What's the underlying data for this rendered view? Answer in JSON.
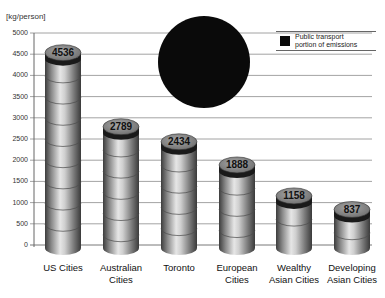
{
  "chart_data": {
    "type": "bar",
    "style": "3D cylinders with dark cap (public transport portion) and a large black circle overlay",
    "title": "",
    "ylabel": "[kg/person]",
    "xlabel": "",
    "ylim": [
      0,
      5000
    ],
    "yticks": [
      0,
      500,
      1000,
      1500,
      2000,
      2500,
      3000,
      3500,
      4000,
      4500,
      5000
    ],
    "grid": true,
    "legend_position": "top-right",
    "categories": [
      "US Cities",
      "Australian Cities",
      "Toronto",
      "European Cities",
      "Wealthy Asian Cities",
      "Developing Asian Cities"
    ],
    "values": [
      4536,
      2789,
      2434,
      1888,
      1158,
      837
    ],
    "series": [
      {
        "name": "Total transport emissions",
        "values": [
          4536,
          2789,
          2434,
          1888,
          1158,
          837
        ]
      }
    ],
    "legend": [
      {
        "label": "Public transport portion of emissions",
        "color": "#0a0a0a"
      }
    ]
  },
  "axis": {
    "unit": "[kg/person]",
    "ticks": [
      "5000",
      "4500",
      "4000",
      "3500",
      "3000",
      "2500",
      "2000",
      "1500",
      "1000",
      "500",
      "0"
    ]
  },
  "legend": {
    "line1": "Public transport",
    "line2": "portion of emissions",
    "swatch_color": "#0a0a0a"
  },
  "bars": [
    {
      "label_line1": "US Cities",
      "label_line2": "",
      "value_text": "4536"
    },
    {
      "label_line1": "Australian",
      "label_line2": "Cities",
      "value_text": "2789"
    },
    {
      "label_line1": "Toronto",
      "label_line2": "",
      "value_text": "2434"
    },
    {
      "label_line1": "European",
      "label_line2": "Cities",
      "value_text": "1888"
    },
    {
      "label_line1": "Wealthy",
      "label_line2": "Asian Cities",
      "value_text": "1158"
    },
    {
      "label_line1": "Developing",
      "label_line2": "Asian Cities",
      "value_text": "837"
    }
  ],
  "colors": {
    "grid": "#888888",
    "cap_dark": "#1a1a1a",
    "top_face": "#8a8a8a",
    "body_light": "#d8d8d8",
    "body_dark": "#5a5a5a",
    "circle": "#0a0a0a"
  }
}
